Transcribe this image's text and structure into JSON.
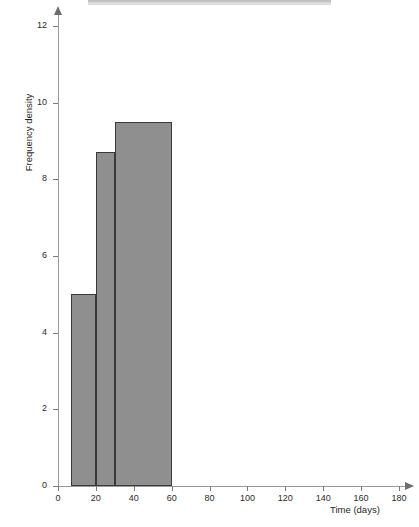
{
  "chart_data": {
    "type": "bar",
    "title": "",
    "subtitle": "",
    "xlabel": "Time (days)",
    "ylabel": "Frequency density",
    "xlim": [
      0,
      185
    ],
    "ylim": [
      0,
      12.4
    ],
    "grid": false,
    "legend": null,
    "x_ticks": [
      0,
      20,
      40,
      60,
      80,
      100,
      120,
      140,
      160,
      180
    ],
    "x_tick_labels": [
      "0",
      "20",
      "40",
      "60",
      "80",
      "100",
      "120",
      "140",
      "160",
      "180"
    ],
    "y_ticks": [
      0,
      2,
      4,
      6,
      8,
      10,
      12
    ],
    "y_tick_labels": [
      "0",
      "2",
      "4",
      "6",
      "8",
      "10",
      "12"
    ],
    "bars": [
      {
        "label": "7-20 days",
        "x_start": 7,
        "x_end": 20,
        "value": 5.0,
        "width_days": 13,
        "frequency": 65
      },
      {
        "label": "20-30 days",
        "x_start": 20,
        "x_end": 30,
        "value": 8.7,
        "width_days": 10,
        "frequency": 87
      },
      {
        "label": "30-60 days",
        "x_start": 30,
        "x_end": 60,
        "value": 9.5,
        "width_days": 30,
        "frequency": 285
      }
    ],
    "bar_fill_color": "#8f8f8f",
    "bar_edge_color": "#3a3a3a",
    "axis_color": "#9a9a9a"
  },
  "footer": {
    "cut_off_line": ""
  }
}
